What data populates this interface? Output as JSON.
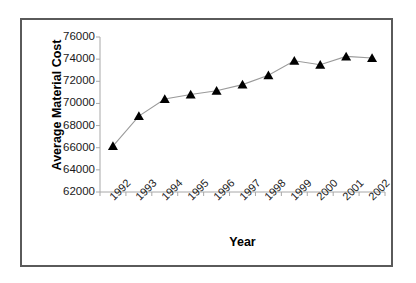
{
  "chart_data": {
    "type": "line",
    "title": "",
    "xlabel": "Year",
    "ylabel": "Average Material Cost",
    "categories": [
      "1992",
      "1993",
      "1994",
      "1995",
      "1996",
      "1997",
      "1998",
      "1999",
      "2000",
      "2001",
      "2002"
    ],
    "values": [
      66150,
      68860,
      70400,
      70800,
      71150,
      71700,
      72550,
      73850,
      73500,
      74250,
      74100
    ],
    "series": [
      {
        "name": "Average Material Cost",
        "values": [
          66150,
          68860,
          70400,
          70800,
          71150,
          71700,
          72550,
          73850,
          73500,
          74250,
          74100
        ]
      }
    ],
    "ylim": [
      62000,
      76000
    ],
    "ytick_labels": [
      "76000",
      "74000",
      "72000",
      "70000",
      "68000",
      "66000",
      "64000",
      "62000"
    ],
    "ytick_values": [
      76000,
      74000,
      72000,
      70000,
      68000,
      66000,
      64000,
      62000
    ],
    "ytick_step": 2000,
    "grid": false,
    "legend": "none",
    "marker": "triangle",
    "marker_color": "#000000",
    "line_color": "#9a9a9a",
    "axis_color": "#a8a8a8",
    "frame_color": "#5a5a5a",
    "background": "#ffffff",
    "xlabel_rotation": -45
  }
}
